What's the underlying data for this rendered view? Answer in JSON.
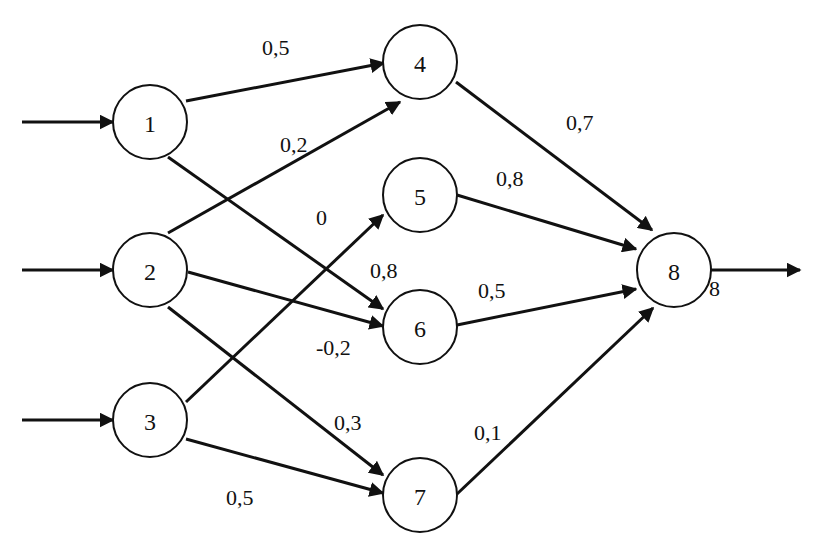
{
  "diagram": {
    "type": "feedforward-neural-network",
    "nodes": [
      {
        "id": "1",
        "label": "1",
        "cx": 150,
        "cy": 122
      },
      {
        "id": "2",
        "label": "2",
        "cx": 150,
        "cy": 270
      },
      {
        "id": "3",
        "label": "3",
        "cx": 150,
        "cy": 420
      },
      {
        "id": "4",
        "label": "4",
        "cx": 420,
        "cy": 62
      },
      {
        "id": "5",
        "label": "5",
        "cx": 420,
        "cy": 195
      },
      {
        "id": "6",
        "label": "6",
        "cx": 420,
        "cy": 327
      },
      {
        "id": "7",
        "label": "7",
        "cx": 420,
        "cy": 495
      },
      {
        "id": "8",
        "label": "8",
        "cx": 674,
        "cy": 270
      }
    ],
    "edges": [
      {
        "from": "1",
        "to": "4",
        "weight": "0,5"
      },
      {
        "from": "1",
        "to": "6",
        "weight": "0,8"
      },
      {
        "from": "2",
        "to": "4",
        "weight": "0,2"
      },
      {
        "from": "2",
        "to": "6",
        "weight": "-0,2"
      },
      {
        "from": "2",
        "to": "7",
        "weight": "0,3"
      },
      {
        "from": "3",
        "to": "5",
        "weight": "0"
      },
      {
        "from": "3",
        "to": "7",
        "weight": "0,5"
      },
      {
        "from": "4",
        "to": "8",
        "weight": "0,7"
      },
      {
        "from": "5",
        "to": "8",
        "weight": "0,8"
      },
      {
        "from": "6",
        "to": "8",
        "weight": "0,5"
      },
      {
        "from": "7",
        "to": "8",
        "weight": "0,1"
      }
    ],
    "inputs": [
      "1",
      "2",
      "3"
    ],
    "output": {
      "from": "8",
      "label": "8"
    },
    "weight_labels": {
      "w14": "0,5",
      "w16": "0,8",
      "w24": "0,2",
      "w26": "-0,2",
      "w27": "0,3",
      "w35": "0",
      "w37": "0,5",
      "w48": "0,7",
      "w58": "0,8",
      "w68": "0,5",
      "w78": "0,1",
      "out8": "8"
    }
  }
}
